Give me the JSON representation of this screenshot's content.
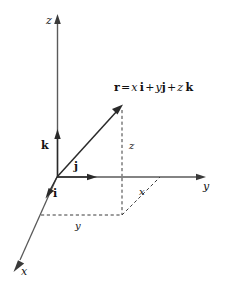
{
  "figure": {
    "kind": "3d-cartesian-coordinate-diagram",
    "background_color": "#ffffff",
    "ink_color": "#111111",
    "axis_color": "#555555"
  },
  "equation": {
    "vector_symbol": "r",
    "equals": "=",
    "term1_scalar": "x",
    "term1_unit": "i",
    "plus1": "+",
    "term2_scalar": "y",
    "term2_unit": "j",
    "plus2": "+",
    "term3_scalar": "z",
    "term3_unit": "k",
    "full_text": "r = x i + y j + z k"
  },
  "axes": [
    {
      "name": "z-axis",
      "label": "z",
      "direction": "up"
    },
    {
      "name": "y-axis",
      "label": "y",
      "direction": "right"
    },
    {
      "name": "x-axis",
      "label": "x",
      "direction": "down-left"
    }
  ],
  "unit_vectors": [
    {
      "name": "k",
      "label": "k",
      "along": "z-axis"
    },
    {
      "name": "j",
      "label": "j",
      "along": "y-axis"
    },
    {
      "name": "i",
      "label": "i",
      "along": "x-axis"
    }
  ],
  "components": [
    {
      "name": "z-component",
      "label": "z",
      "style": "dashed-vertical"
    },
    {
      "name": "x-component",
      "label": "x",
      "style": "dashed-diagonal"
    },
    {
      "name": "y-component",
      "label": "y",
      "style": "dashed-horizontal"
    }
  ]
}
